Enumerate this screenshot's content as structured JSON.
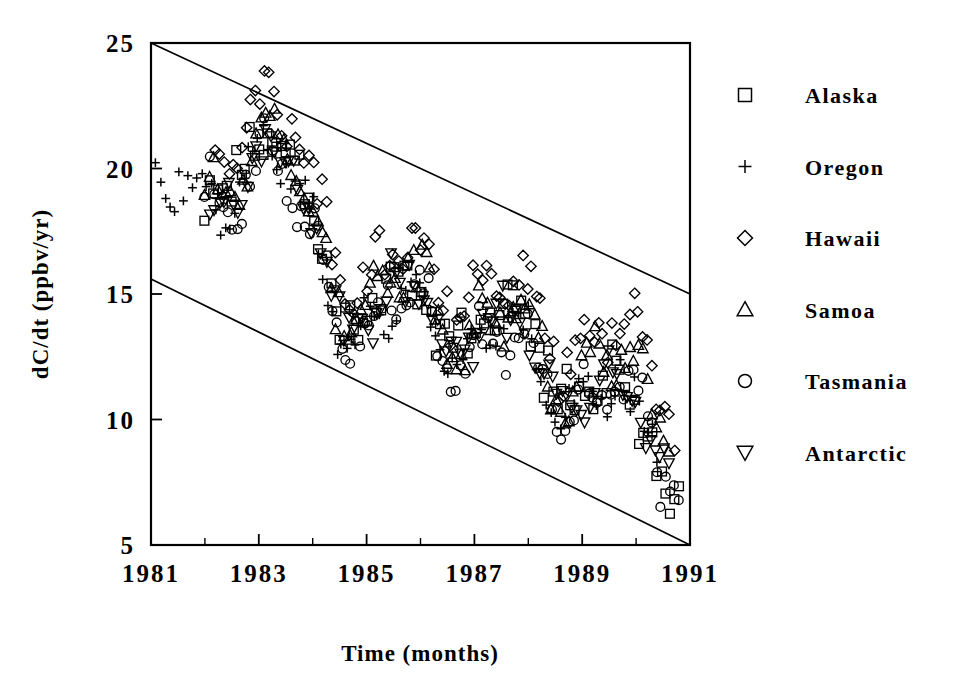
{
  "chart_data": {
    "type": "scatter",
    "title": "",
    "xlabel": "Time (months)",
    "ylabel": "dC/dt (ppbv/yr)",
    "xlim": [
      1981,
      1991
    ],
    "ylim": [
      5,
      25
    ],
    "xticks": [
      1981,
      1982,
      1983,
      1984,
      1985,
      1986,
      1987,
      1988,
      1989,
      1990,
      1991
    ],
    "xtick_labels": [
      "1981",
      "",
      "1983",
      "",
      "1985",
      "",
      "1987",
      "",
      "1989",
      "",
      "1991"
    ],
    "yticks": [
      5,
      10,
      15,
      20,
      25
    ],
    "ytick_labels": [
      "5",
      "10",
      "15",
      "20",
      "25"
    ],
    "grid": false,
    "legend_position": "right",
    "annotations": [],
    "trend_lines": [
      {
        "name": "upper-envelope",
        "x0": 1981.0,
        "y0": 25.0,
        "x1": 1991.0,
        "y1": 15.0,
        "slope_per_year": -1.0
      },
      {
        "name": "lower-envelope",
        "x0": 1981.0,
        "y0": 15.6,
        "x1": 1991.0,
        "y1": 5.0,
        "slope_per_year": -1.06
      }
    ],
    "series": [
      {
        "name": "Alaska",
        "marker": "square",
        "x_start": 1982.0,
        "x_end": 1990.8,
        "n": 106,
        "seed": 11,
        "baseline_offset": 0.0,
        "scatter": 1.05,
        "late_drop": 2.4
      },
      {
        "name": "Oregon",
        "marker": "plus",
        "x_start": 1981.0,
        "x_end": 1990.4,
        "n": 110,
        "seed": 23,
        "baseline_offset": -0.55,
        "scatter": 0.95,
        "late_drop": 1.1
      },
      {
        "name": "Hawaii",
        "marker": "diamond",
        "x_start": 1982.2,
        "x_end": 1990.7,
        "n": 104,
        "seed": 37,
        "baseline_offset": 1.35,
        "scatter": 1.0,
        "late_drop": 0.2
      },
      {
        "name": "Samoa",
        "marker": "triangle-up",
        "x_start": 1982.0,
        "x_end": 1990.6,
        "n": 108,
        "seed": 53,
        "baseline_offset": 0.15,
        "scatter": 1.1,
        "late_drop": 0.1
      },
      {
        "name": "Tasmania",
        "marker": "circle",
        "x_start": 1982.0,
        "x_end": 1990.8,
        "n": 105,
        "seed": 71,
        "baseline_offset": -0.75,
        "scatter": 0.9,
        "late_drop": 0.9
      },
      {
        "name": "Antarctic",
        "marker": "triangle-down",
        "x_start": 1982.1,
        "x_end": 1990.6,
        "n": 100,
        "seed": 97,
        "baseline_offset": -0.35,
        "scatter": 0.95,
        "late_drop": 1.5
      }
    ],
    "envelope_trend": {
      "y_at_1981": 19.6,
      "slope_per_year": -0.95,
      "seasonal_amplitude": 1.25,
      "seasonal_period_years": 2.05,
      "ramp_start_year": 1982.0,
      "ramp_peak_year": 1983.0,
      "ramp_peak_boost": 3.5,
      "trough_year": 1985.0,
      "trough_depth": 1.6
    }
  },
  "legend": {
    "entries": [
      {
        "label": "Alaska",
        "marker": "square"
      },
      {
        "label": "Oregon",
        "marker": "plus"
      },
      {
        "label": "Hawaii",
        "marker": "diamond"
      },
      {
        "label": "Samoa",
        "marker": "triangle-up"
      },
      {
        "label": "Tasmania",
        "marker": "circle"
      },
      {
        "label": "Antarctic",
        "marker": "triangle-down"
      }
    ]
  },
  "colors": {
    "ink": "#000000",
    "background": "#ffffff"
  }
}
